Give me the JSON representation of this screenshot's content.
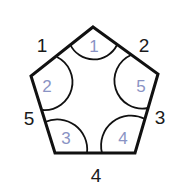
{
  "diagram": {
    "type": "pentagon",
    "stroke_color": "#111111",
    "angle_label_color": "#8a93c4",
    "side_labels": [
      {
        "text": "1",
        "x": 42,
        "y": 52
      },
      {
        "text": "2",
        "x": 144,
        "y": 52
      },
      {
        "text": "3",
        "x": 156,
        "y": 124
      },
      {
        "text": "4",
        "x": 92,
        "y": 182
      },
      {
        "text": "5",
        "x": 22,
        "y": 125
      }
    ],
    "angle_labels": [
      {
        "text": "1",
        "x": 93,
        "y": 53
      },
      {
        "text": "2",
        "x": 47,
        "y": 92
      },
      {
        "text": "3",
        "x": 65,
        "y": 143
      },
      {
        "text": "4",
        "x": 123,
        "y": 143
      },
      {
        "text": "5",
        "x": 141,
        "y": 92
      }
    ]
  }
}
